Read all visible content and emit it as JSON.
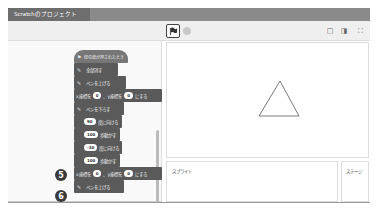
{
  "window": {
    "title": "Scratchのプロジェクト"
  },
  "toolbar": {
    "green_flag_icon": "green-flag-icon",
    "stop_icon": "stop-icon",
    "layout_small": "□",
    "layout_normal": "◨",
    "fullscreen": "⛶"
  },
  "code": {
    "blocks": [
      {
        "label": "緑の旗が押されたとき"
      },
      {
        "label": "全部消す"
      },
      {
        "label": "ペンを上げる"
      },
      {
        "pre": "x座標を",
        "x": "0",
        "mid": "、y座標を",
        "y": "0",
        "post": "にする"
      },
      {
        "label": "ペンを下ろす"
      },
      {
        "value": "90",
        "label": "度に向ける"
      },
      {
        "value": "100",
        "label": "歩動かす"
      },
      {
        "value": "-30",
        "label": "度に向ける"
      },
      {
        "value": "100",
        "label": "歩動かす"
      },
      {
        "pre": "x座標を",
        "x": "0",
        "mid": "、y座標を",
        "y": "0",
        "post": "にする"
      },
      {
        "label": "ペンを上げる"
      }
    ],
    "step_markers": [
      "5",
      "6"
    ]
  },
  "stage": {
    "drawing": "triangle"
  },
  "sprite_panel": {
    "label": "スプライト"
  },
  "stage_panel": {
    "label": "ステージ"
  }
}
